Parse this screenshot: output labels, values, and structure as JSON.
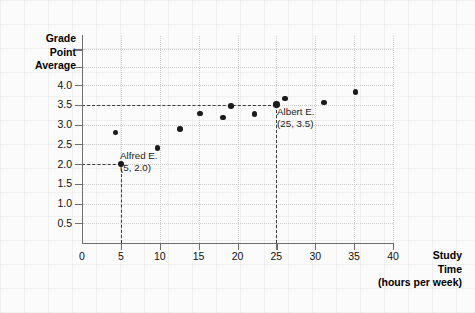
{
  "chart_data": {
    "type": "scatter",
    "title": "",
    "xlabel": "Study Time (hours per week)",
    "ylabel": "Grade Point Average",
    "xlim": [
      0,
      40
    ],
    "ylim": [
      0,
      4.0
    ],
    "grid": true,
    "legend": "none",
    "x_ticks": [
      "0",
      "5",
      "10",
      "15",
      "20",
      "25",
      "30",
      "35",
      "40"
    ],
    "x_tick_values": [
      0,
      5,
      10,
      15,
      20,
      25,
      30,
      35,
      40
    ],
    "y_ticks": [
      "0.5",
      "1.0",
      "1.5",
      "2.0",
      "2.5",
      "3.0",
      "3.5",
      "4.0"
    ],
    "y_tick_values": [
      0.5,
      1.0,
      1.5,
      2.0,
      2.5,
      3.0,
      3.5,
      4.0
    ],
    "points": [
      {
        "x": 4.3,
        "y": 2.8,
        "label": ""
      },
      {
        "x": 5.0,
        "y": 2.0,
        "label": "Alfred E."
      },
      {
        "x": 9.7,
        "y": 2.4,
        "label": ""
      },
      {
        "x": 12.6,
        "y": 2.88,
        "label": ""
      },
      {
        "x": 15.2,
        "y": 3.28,
        "label": ""
      },
      {
        "x": 18.1,
        "y": 3.18,
        "label": ""
      },
      {
        "x": 19.2,
        "y": 3.47,
        "label": ""
      },
      {
        "x": 22.2,
        "y": 3.27,
        "label": ""
      },
      {
        "x": 25.0,
        "y": 3.5,
        "label": "Albert E."
      },
      {
        "x": 26.1,
        "y": 3.66,
        "label": ""
      },
      {
        "x": 31.1,
        "y": 3.56,
        "label": ""
      },
      {
        "x": 35.2,
        "y": 3.83,
        "label": ""
      }
    ],
    "annotations": [
      {
        "name": "Alfred E.",
        "coords": "(5, 2.0)",
        "x": 5,
        "y": 2.0
      },
      {
        "name": "Albert E.",
        "coords": "(25, 3.5)",
        "x": 25,
        "y": 3.5
      }
    ],
    "guides": [
      {
        "orientation": "horizontal",
        "value": 2.0
      },
      {
        "orientation": "vertical",
        "value": 5
      },
      {
        "orientation": "horizontal",
        "value": 3.5
      },
      {
        "orientation": "vertical",
        "value": 25
      }
    ]
  },
  "axis_titles": {
    "y_line1": "Grade",
    "y_line2": "Point",
    "y_line3": "Average",
    "x_line1": "Study",
    "x_line2": "Time",
    "x_line3": "(hours per week)"
  },
  "colors": {
    "point": "#1b1b1b",
    "axis": "#6e6e6e",
    "grid": "#cdcdcd",
    "guide": "#3a3a3a",
    "background": "#fbfbfb",
    "text": "#111111"
  }
}
